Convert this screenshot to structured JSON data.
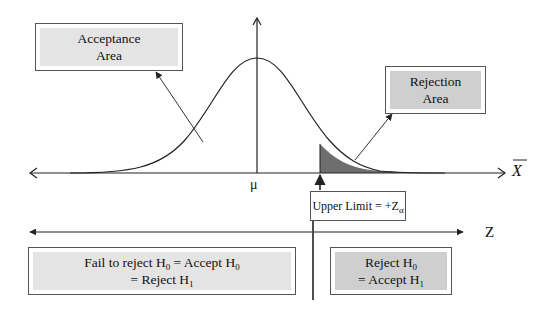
{
  "diagram": {
    "acceptance_box": {
      "line1": "Acceptance",
      "line2": "Area"
    },
    "rejection_box": {
      "line1": "Rejection",
      "line2": "Area"
    },
    "mean_label": "μ",
    "xbar_axis_label": "X",
    "z_axis_label": "Z",
    "upper_limit_box": {
      "text": "Upper Limit = +Z",
      "sub": "α"
    },
    "fail_to_reject_box": {
      "line1_a": "Fail to reject H",
      "line1_sub_a": "0",
      "line1_b": " = Accept H",
      "line1_sub_b": "0",
      "line2_a": "= Reject H",
      "line2_sub": "1"
    },
    "reject_box": {
      "line1": "Reject H",
      "line1_sub": "0",
      "line2": "= Accept H",
      "line2_sub": "1"
    },
    "colors": {
      "rejection_shade": "#6e6e6e",
      "box_fill_light": "#e4e4e4",
      "box_fill_dark": "#cfcfcf",
      "line": "#222222"
    }
  }
}
